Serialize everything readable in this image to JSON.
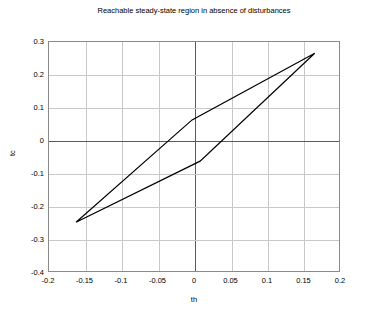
{
  "chart_data": {
    "type": "line",
    "title": "Reachable steady-state region in absence of disturbances",
    "xlabel": "th",
    "ylabel": "tc",
    "xlim": [
      -0.2,
      0.2
    ],
    "ylim": [
      -0.4,
      0.3
    ],
    "xticks": [
      -0.2,
      -0.15,
      -0.1,
      -0.05,
      0,
      0.05,
      0.1,
      0.15,
      0.2
    ],
    "xticklabels": [
      "-0.2",
      "-0.15",
      "-0.1",
      "-0.05",
      "0",
      "0.05",
      "0.1",
      "0.15",
      "0.2"
    ],
    "yticks": [
      -0.4,
      -0.3,
      -0.2,
      -0.1,
      0,
      0.1,
      0.2,
      0.3
    ],
    "yticklabels": [
      "-0.4",
      "-0.3",
      "-0.2",
      "-0.1",
      "0",
      "0.1",
      "0.2",
      "0.3"
    ],
    "grid": true,
    "legend": null,
    "line_color": "#000000",
    "line_width": 1.2,
    "series": [
      {
        "name": "reachable-region-boundary",
        "closed": true,
        "points": [
          {
            "x": -0.163,
            "y": -0.246
          },
          {
            "x": -0.004,
            "y": 0.064
          },
          {
            "x": 0.164,
            "y": 0.266
          },
          {
            "x": 0.007,
            "y": -0.061
          },
          {
            "x": -0.163,
            "y": -0.246
          }
        ]
      }
    ],
    "vertices": [
      {
        "label": "lower-left-vertex",
        "x": -0.163,
        "y": -0.246
      },
      {
        "label": "upper-kink-vertex",
        "x": -0.004,
        "y": 0.064
      },
      {
        "label": "upper-right-vertex",
        "x": 0.164,
        "y": 0.266
      },
      {
        "label": "lower-kink-vertex",
        "x": 0.007,
        "y": -0.061
      }
    ]
  }
}
